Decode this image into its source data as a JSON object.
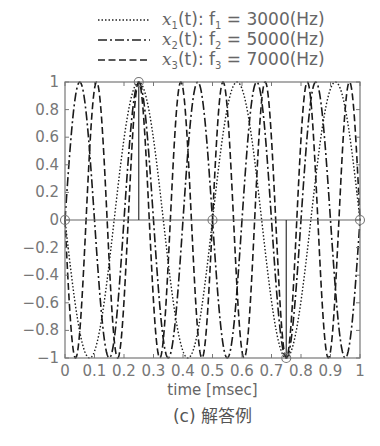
{
  "legend": [
    {
      "name": "x1",
      "var": "x",
      "sub": "1",
      "text_mid": "(t): f",
      "fsub": "1",
      "text_end": " = 3000(Hz)",
      "style": "dotted",
      "dash": "1.5,2"
    },
    {
      "name": "x2",
      "var": "x",
      "sub": "2",
      "text_mid": "(t): f",
      "fsub": "2",
      "text_end": " = 5000(Hz)",
      "style": "dashdot",
      "dash": "9,3,2,3"
    },
    {
      "name": "x3",
      "var": "x",
      "sub": "3",
      "text_mid": "(t): f",
      "fsub": "3",
      "text_end": " = 7000(Hz)",
      "style": "dashed",
      "dash": "7,3.5"
    }
  ],
  "axes": {
    "xlabel": "time [msec]",
    "caption": "(c) 解答例"
  },
  "chart_data": {
    "type": "line",
    "title": "",
    "xlabel": "time [msec]",
    "ylabel": "",
    "xlim": [
      0,
      1
    ],
    "ylim": [
      -1,
      1
    ],
    "xticks": [
      "0",
      "0.1",
      "0.2",
      "0.3",
      "0.4",
      "0.5",
      "0.6",
      "0.7",
      "0.8",
      "0.9",
      "1"
    ],
    "yticks": [
      "1",
      "0.8",
      "0.6",
      "0.4",
      "0.2",
      "0",
      "−0.2",
      "−0.4",
      "−0.6",
      "−0.8",
      "−1"
    ],
    "series": [
      {
        "name": "x1(t): f1 = 3000(Hz)",
        "freq_khz": 3,
        "sign": -1,
        "style": "dotted"
      },
      {
        "name": "x2(t): f2 = 5000(Hz)",
        "freq_khz": 5,
        "sign": 1,
        "style": "dashdot"
      },
      {
        "name": "x3(t): f3 = 7000(Hz)",
        "freq_khz": 7,
        "sign": -1,
        "style": "dashed"
      }
    ],
    "sample_points": {
      "t": [
        0,
        0.25,
        0.5,
        0.75,
        1.0
      ],
      "y": [
        0,
        1,
        0,
        -1,
        0
      ],
      "marker": "circle"
    },
    "grid": false,
    "legend_position": "top"
  }
}
